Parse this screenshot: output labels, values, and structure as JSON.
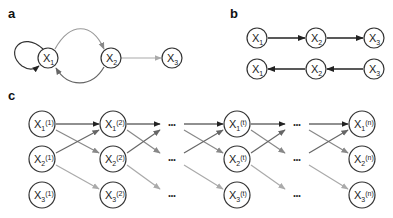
{
  "panels": {
    "a": {
      "label": "a",
      "nodes": [
        {
          "id": "X1",
          "base": "X",
          "sub": "1"
        },
        {
          "id": "X2",
          "base": "X",
          "sub": "2"
        },
        {
          "id": "X3",
          "base": "X",
          "sub": "3"
        }
      ],
      "edges": [
        {
          "from": "X1",
          "to": "X1",
          "style": "self-loop",
          "color": "#333333"
        },
        {
          "from": "X1",
          "to": "X2",
          "style": "arc-top",
          "color": "#999999"
        },
        {
          "from": "X2",
          "to": "X1",
          "style": "arc-bottom",
          "color": "#555555"
        },
        {
          "from": "X2",
          "to": "X3",
          "style": "straight",
          "color": "#aaaaaa"
        }
      ]
    },
    "b": {
      "label": "b",
      "rows": [
        {
          "nodes": [
            {
              "base": "X",
              "sub": "1"
            },
            {
              "base": "X",
              "sub": "2"
            },
            {
              "base": "X",
              "sub": "3"
            }
          ],
          "direction": "forward"
        },
        {
          "nodes": [
            {
              "base": "X",
              "sub": "1"
            },
            {
              "base": "X",
              "sub": "2"
            },
            {
              "base": "X",
              "sub": "3"
            }
          ],
          "direction": "backward"
        }
      ]
    },
    "c": {
      "label": "c",
      "columns": [
        {
          "type": "node",
          "time": "(1)"
        },
        {
          "type": "node",
          "time": "(2)"
        },
        {
          "type": "ellipsis",
          "text": "•••"
        },
        {
          "type": "node",
          "time": "(t)"
        },
        {
          "type": "ellipsis",
          "text": "•••"
        },
        {
          "type": "node",
          "time": "(n)"
        }
      ],
      "variables": [
        {
          "base": "X",
          "sub": "1"
        },
        {
          "base": "X",
          "sub": "2"
        },
        {
          "base": "X",
          "sub": "3"
        }
      ],
      "edge_colors": {
        "x1_to_x1": "#222222",
        "x1_to_x2": "#888888",
        "x2_to_x1": "#666666",
        "x2_to_x3": "#aaaaaa"
      }
    }
  },
  "colors": {
    "node_stroke": "#333333",
    "text": "#222222",
    "dark_edge": "#222222",
    "mid_edge": "#777777",
    "light_edge": "#aaaaaa"
  }
}
